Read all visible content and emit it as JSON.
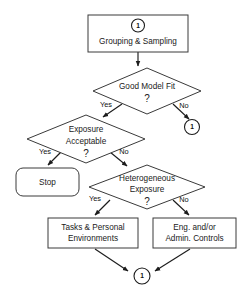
{
  "diagram": {
    "background_color": "#ffffff",
    "line_color": "#1c1c1c",
    "box_stroke_color": "#3a3a3a",
    "text_color": "#1a1a1a",
    "nodes": {
      "grouping_box": {
        "label": "Grouping & Sampling",
        "connector_label": "1",
        "shape": "rectangle"
      },
      "good_model_fit": {
        "label_line1": "Good Model Fit",
        "label_line2": "?",
        "shape": "diamond"
      },
      "connector_right": {
        "label": "1",
        "shape": "circle"
      },
      "exposure_acceptable": {
        "label_line1": "Exposure",
        "label_line2": "Acceptable",
        "label_line3": "?",
        "shape": "diamond"
      },
      "stop_box": {
        "label": "Stop",
        "shape": "rounded-rectangle"
      },
      "heterogeneous_exposure": {
        "label_line1": "Heterogeneous",
        "label_line2": "Exposure",
        "label_line3": "?",
        "shape": "diamond"
      },
      "tasks_personal": {
        "label_line1": "Tasks & Personal",
        "label_line2": "Environments",
        "shape": "rectangle"
      },
      "eng_admin": {
        "label_line1": "Eng. and/or",
        "label_line2": "Admin. Controls",
        "shape": "rectangle"
      },
      "connector_bottom": {
        "label": "1",
        "shape": "circle"
      }
    },
    "edge_labels": {
      "model_fit_yes": "Yes",
      "model_fit_no": "No",
      "exposure_yes": "Yes",
      "exposure_no": "No",
      "hetero_yes": "Yes",
      "hetero_no": "No"
    }
  }
}
